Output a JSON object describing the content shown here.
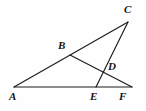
{
  "figure": {
    "name": "triangle-cevian-diagram",
    "type": "geometry-line-diagram",
    "background_color": "#fefefe",
    "line_color": "#1b1b1b",
    "label_color": "#141414",
    "width": 146,
    "height": 111
  },
  "points": {
    "A": {
      "label": "A",
      "x": 14,
      "y": 87,
      "label_x": 9,
      "label_y": 91
    },
    "B": {
      "label": "B",
      "x": 70,
      "y": 55,
      "label_x": 58,
      "label_y": 40
    },
    "C": {
      "label": "C",
      "x": 128,
      "y": 22,
      "label_x": 124,
      "label_y": 4
    },
    "D": {
      "label": "D",
      "x": 106,
      "y": 72,
      "label_x": 108,
      "label_y": 61
    },
    "E": {
      "label": "E",
      "x": 96,
      "y": 87,
      "label_x": 90,
      "label_y": 91
    },
    "F": {
      "label": "F",
      "x": 132,
      "y": 87,
      "label_x": 119,
      "label_y": 91
    }
  },
  "segments": [
    {
      "name": "segment-AF-base",
      "from": "A",
      "to": "F",
      "endpoints": "A-F"
    },
    {
      "name": "segment-AC",
      "from": "A",
      "to": "C",
      "endpoints": "A-C",
      "passes_through": "B"
    },
    {
      "name": "segment-BF",
      "from": "B",
      "to": "F",
      "endpoints": "B-F",
      "passes_through": "D"
    },
    {
      "name": "segment-EC",
      "from": "E",
      "to": "C",
      "endpoints": "E-C",
      "passes_through": "D"
    }
  ],
  "labels_order": [
    "C",
    "B",
    "D",
    "A",
    "E",
    "F"
  ]
}
